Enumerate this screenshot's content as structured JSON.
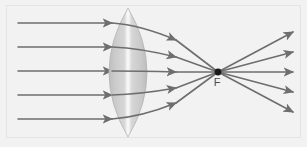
{
  "figure": {
    "background_color": "#f2f2f2",
    "frame_color": "#e4e4e4",
    "width": 307,
    "height": 147
  },
  "lens": {
    "name": "biconvex-converging-lens",
    "center_x": 128,
    "top_y": 8,
    "bottom_y": 137,
    "half_width": 19,
    "body_color": "#c9c9c9",
    "edge_color": "#bdbdbd",
    "highlight_color": "#fbfbfb",
    "highlight_width": 5
  },
  "focal_point": {
    "name": "focal-point",
    "label": "F",
    "x": 218,
    "y": 72,
    "dot_radius": 3.4,
    "dot_color": "#1a1a1a",
    "label_x": 217,
    "label_y": 86,
    "label_color": "#4a4a4a"
  },
  "rays": {
    "stroke_color": "#6e6e6e",
    "stroke_width": 1.6,
    "arrow_color": "#6e6e6e",
    "incident": {
      "name": "incident-parallel-rays",
      "description": "Parallel rays travelling left to right toward the lens",
      "count": 5,
      "start_x": 18,
      "arrow_tip_x": 112,
      "y_values": [
        23,
        47,
        71,
        95,
        119
      ]
    },
    "refracted": {
      "name": "refracted-converging-rays",
      "description": "Rays bent by the lens converging on the focal point F",
      "count": 5,
      "exit_x": 112,
      "arrow_tip_x": 176,
      "entry_y_values": [
        23,
        47,
        71,
        95,
        119
      ],
      "arrow_tip_y_values": [
        40,
        57,
        72,
        88,
        103
      ]
    },
    "diverging": {
      "name": "diverging-rays-after-focus",
      "description": "Rays spreading out beyond the focal point F",
      "count": 5,
      "start_x": 218,
      "start_y": 72,
      "arrow_tip_x": 293,
      "arrow_tip_y_values": [
        32,
        52,
        72,
        92,
        112
      ]
    }
  }
}
